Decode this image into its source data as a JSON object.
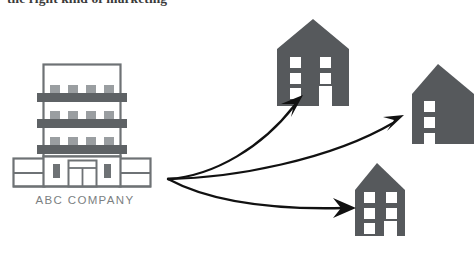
{
  "headline": {
    "text": "the right kind of marketing"
  },
  "colors": {
    "background": "#ffffff",
    "building_fill": "#56595c",
    "building_window": "#ffffff",
    "office_outline": "#6e7275",
    "office_band": "#5e6265",
    "office_window": "#9a9ea1",
    "arrow": "#111111",
    "label_text": "#7c7f82"
  },
  "main_building": {
    "name": "ABC COMPANY",
    "label": "ABC COMPANY",
    "floors": 3,
    "windows_per_floor": 4,
    "entrance": "double-door"
  },
  "target_buildings": [
    {
      "id": "house-top",
      "window_columns": 2,
      "window_rows": 3,
      "has_door": true
    },
    {
      "id": "house-right",
      "window_columns": 1,
      "window_rows": 3,
      "has_door": false
    },
    {
      "id": "house-bottom",
      "window_columns": 2,
      "window_rows": 3,
      "has_door": true
    }
  ],
  "arrows": [
    {
      "id": "arrow-to-top",
      "from": "ABC COMPANY",
      "to": "house-top"
    },
    {
      "id": "arrow-to-right",
      "from": "ABC COMPANY",
      "to": "house-right"
    },
    {
      "id": "arrow-to-bottom",
      "from": "ABC COMPANY",
      "to": "house-bottom"
    }
  ]
}
